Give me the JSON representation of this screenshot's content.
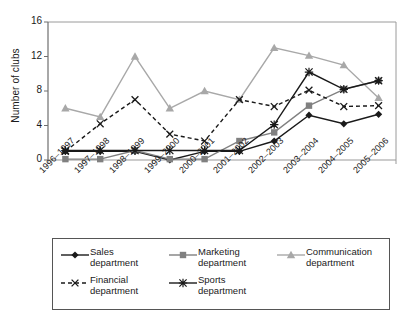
{
  "chart_data": {
    "type": "line",
    "title": "",
    "xlabel": "",
    "ylabel": "Number of clubs",
    "categories": [
      "1996–1997",
      "1997–1998",
      "1998–1999",
      "1999–2000",
      "2000–2001",
      "2001–2002",
      "2002–2003",
      "2003–2004",
      "2004–2005",
      "2005–2006"
    ],
    "ylim": [
      0,
      16
    ],
    "yticks": [
      0,
      4,
      8,
      12,
      16
    ],
    "grid": false,
    "legend_position": "bottom",
    "series": [
      {
        "name": "Sales department",
        "values": [
          1,
          1,
          1,
          0,
          1,
          1,
          2.2,
          5.2,
          4.2,
          5.3
        ],
        "color": "#1a1a1a",
        "marker": "diamond",
        "dash": "solid"
      },
      {
        "name": "Marketing department",
        "values": [
          0.1,
          0.1,
          1.1,
          0.1,
          0.1,
          2.2,
          3.2,
          6.3,
          8.2,
          9.2
        ],
        "color": "#808080",
        "marker": "square",
        "dash": "solid"
      },
      {
        "name": "Communication department",
        "values": [
          6,
          5,
          12,
          6,
          8,
          7,
          13,
          12.1,
          11,
          7.2
        ],
        "color": "#a8a8a8",
        "marker": "triangle",
        "dash": "solid"
      },
      {
        "name": "Financial department",
        "values": [
          1,
          4.2,
          7,
          3,
          2.2,
          7,
          6.2,
          8.1,
          6.2,
          6.3
        ],
        "color": "#1a1a1a",
        "marker": "x",
        "dash": "dashed"
      },
      {
        "name": "Sports department",
        "values": [
          1.1,
          1.1,
          1.1,
          1.1,
          1.1,
          1.1,
          4.1,
          10.2,
          8.2,
          9.2
        ],
        "color": "#1a1a1a",
        "marker": "asterisk",
        "dash": "solid"
      }
    ]
  },
  "legend": {
    "entries": [
      {
        "line1": "Sales",
        "line2": "department"
      },
      {
        "line1": "Marketing",
        "line2": "department"
      },
      {
        "line1": "Communication",
        "line2": "department"
      },
      {
        "line1": "Financial",
        "line2": "department"
      },
      {
        "line1": "Sports",
        "line2": "department"
      }
    ]
  }
}
